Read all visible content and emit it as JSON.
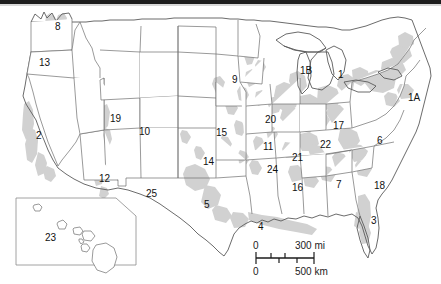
{
  "map": {
    "title": "Numbered United States Map",
    "region_labels": [
      {
        "id": "label-1",
        "text": "1",
        "x": 338,
        "y": 70,
        "state_hint": "Michigan"
      },
      {
        "id": "label-1A",
        "text": "1A",
        "x": 408,
        "y": 93,
        "state_hint": "New Jersey"
      },
      {
        "id": "label-1B",
        "text": "1B",
        "x": 300,
        "y": 66,
        "state_hint": "Wisconsin"
      },
      {
        "id": "label-2",
        "text": "2",
        "x": 36,
        "y": 131,
        "state_hint": "California"
      },
      {
        "id": "label-3",
        "text": "3",
        "x": 371,
        "y": 216,
        "state_hint": "Florida"
      },
      {
        "id": "label-4",
        "text": "4",
        "x": 258,
        "y": 222,
        "state_hint": "Louisiana"
      },
      {
        "id": "label-5",
        "text": "5",
        "x": 204,
        "y": 200,
        "state_hint": "Texas"
      },
      {
        "id": "label-6",
        "text": "6",
        "x": 377,
        "y": 136,
        "state_hint": "Virginia"
      },
      {
        "id": "label-7",
        "text": "7",
        "x": 336,
        "y": 180,
        "state_hint": "Georgia"
      },
      {
        "id": "label-8",
        "text": "8",
        "x": 55,
        "y": 22,
        "state_hint": "Washington"
      },
      {
        "id": "label-9",
        "text": "9",
        "x": 232,
        "y": 75,
        "state_hint": "Minnesota"
      },
      {
        "id": "label-10",
        "text": "10",
        "x": 139,
        "y": 127,
        "state_hint": "Utah"
      },
      {
        "id": "label-11",
        "text": "11",
        "x": 263,
        "y": 142,
        "state_hint": "Missouri"
      },
      {
        "id": "label-12",
        "text": "12",
        "x": 99,
        "y": 174,
        "state_hint": "Arizona"
      },
      {
        "id": "label-13",
        "text": "13",
        "x": 39,
        "y": 58,
        "state_hint": "Oregon"
      },
      {
        "id": "label-14",
        "text": "14",
        "x": 203,
        "y": 157,
        "state_hint": "Oklahoma"
      },
      {
        "id": "label-15",
        "text": "15",
        "x": 216,
        "y": 128,
        "state_hint": "Kansas"
      },
      {
        "id": "label-16",
        "text": "16",
        "x": 292,
        "y": 183,
        "state_hint": "Mississippi"
      },
      {
        "id": "label-17",
        "text": "17",
        "x": 333,
        "y": 121,
        "state_hint": "West Virginia"
      },
      {
        "id": "label-18",
        "text": "18",
        "x": 374,
        "y": 181,
        "state_hint": "South Carolina"
      },
      {
        "id": "label-19",
        "text": "19",
        "x": 110,
        "y": 114,
        "state_hint": "Wyoming"
      },
      {
        "id": "label-20",
        "text": "20",
        "x": 265,
        "y": 115,
        "state_hint": "Illinois"
      },
      {
        "id": "label-21",
        "text": "21",
        "x": 292,
        "y": 153,
        "state_hint": "Tennessee"
      },
      {
        "id": "label-22",
        "text": "22",
        "x": 320,
        "y": 140,
        "state_hint": "Kentucky"
      },
      {
        "id": "label-23",
        "text": "23",
        "x": 45,
        "y": 233,
        "state_hint": "Hawaii"
      },
      {
        "id": "label-24",
        "text": "24",
        "x": 267,
        "y": 165,
        "state_hint": "Arkansas"
      },
      {
        "id": "label-25",
        "text": "25",
        "x": 146,
        "y": 189,
        "state_hint": "New Mexico"
      }
    ],
    "scale": {
      "miles_zero": "0",
      "miles_max": "300 mi",
      "km_zero": "0",
      "km_max": "500 km"
    },
    "colors": {
      "land_fill": "#ffffff",
      "state_border": "#6f6f6f",
      "coast_line": "#5a5a5a",
      "urban_shading": "#c9c9c9",
      "label_text": "#111111",
      "top_band": "#1d1d1d",
      "background": "#ffffff"
    }
  }
}
